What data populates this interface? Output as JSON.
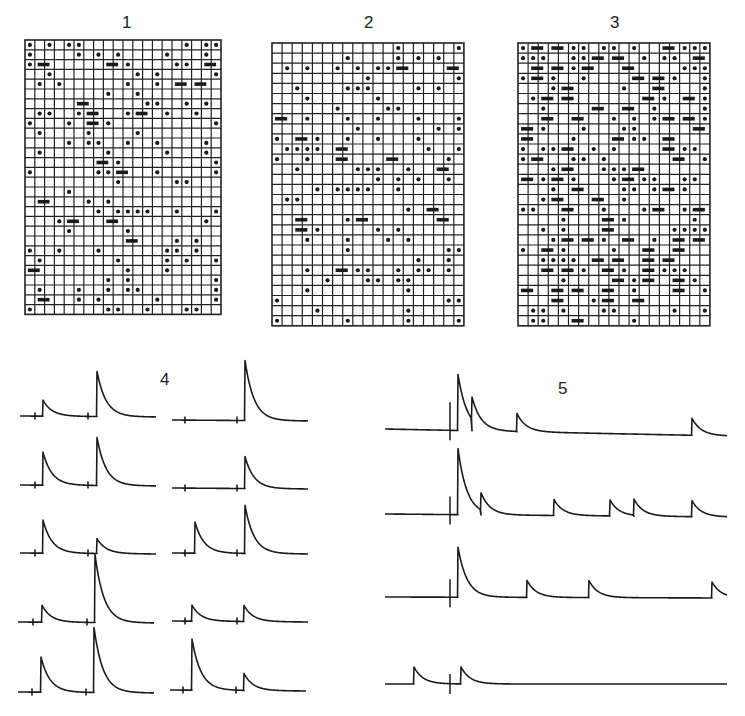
{
  "figure": {
    "panels": [
      {
        "id": "1",
        "label": "1",
        "label_pos": [
          122,
          14
        ]
      },
      {
        "id": "2",
        "label": "2",
        "label_pos": [
          364,
          14
        ]
      },
      {
        "id": "3",
        "label": "3",
        "label_pos": [
          610,
          14
        ]
      },
      {
        "id": "4",
        "label": "4",
        "label_pos": [
          160,
          371
        ]
      },
      {
        "id": "5",
        "label": "5",
        "label_pos": [
          558,
          380
        ]
      }
    ],
    "colors": {
      "ink": "#1a1a1a",
      "grid": "#222222",
      "background": "#ffffff"
    }
  },
  "grids": [
    {
      "name": "grid-panel-1",
      "x": 25,
      "y": 40,
      "cols": 20,
      "rows": 28,
      "cell": 9.8,
      "skew_top": -2,
      "density": 0.26,
      "pair_rate": 0.18,
      "seed": 11
    },
    {
      "name": "grid-panel-2",
      "x": 272,
      "y": 43,
      "cols": 19,
      "rows": 28,
      "cell": 10.1,
      "skew_top": -3,
      "density": 0.18,
      "pair_rate": 0.14,
      "seed": 23
    },
    {
      "name": "grid-panel-3",
      "x": 518,
      "y": 43,
      "cols": 19,
      "rows": 28,
      "cell": 10.1,
      "skew_top": -2,
      "density": 0.42,
      "pair_rate": 0.45,
      "seed": 37
    }
  ],
  "traces_panel4": {
    "decay": 9,
    "width": 136,
    "rows": [
      {
        "left": {
          "x": 20,
          "y": 416,
          "ticks": [
            35,
            88
          ],
          "peaks": [
            {
              "x": 43,
              "h": 16
            },
            {
              "x": 97,
              "h": 45
            }
          ]
        },
        "right": {
          "x": 172,
          "y": 420,
          "ticks": [
            185,
            237
          ],
          "peaks": [
            {
              "x": 245,
              "h": 60
            }
          ]
        }
      },
      {
        "left": {
          "x": 20,
          "y": 485,
          "ticks": [
            35,
            88
          ],
          "peaks": [
            {
              "x": 43,
              "h": 33
            },
            {
              "x": 97,
              "h": 48
            }
          ]
        },
        "right": {
          "x": 172,
          "y": 488,
          "ticks": [
            185,
            237
          ],
          "peaks": [
            {
              "x": 245,
              "h": 32
            }
          ]
        }
      },
      {
        "left": {
          "x": 20,
          "y": 553,
          "ticks": [
            35,
            88
          ],
          "peaks": [
            {
              "x": 43,
              "h": 33
            },
            {
              "x": 97,
              "h": 15
            }
          ]
        },
        "right": {
          "x": 172,
          "y": 553,
          "ticks": [
            185,
            237
          ],
          "peaks": [
            {
              "x": 195,
              "h": 31
            },
            {
              "x": 245,
              "h": 48
            }
          ]
        }
      },
      {
        "left": {
          "x": 18,
          "y": 622,
          "ticks": [
            33,
            87
          ],
          "peaks": [
            {
              "x": 42,
              "h": 17
            },
            {
              "x": 95,
              "h": 68
            }
          ]
        },
        "right": {
          "x": 172,
          "y": 621,
          "ticks": [
            185,
            237
          ],
          "peaks": [
            {
              "x": 192,
              "h": 16
            },
            {
              "x": 244,
              "h": 16
            }
          ]
        }
      },
      {
        "left": {
          "x": 18,
          "y": 692,
          "ticks": [
            32,
            86
          ],
          "peaks": [
            {
              "x": 41,
              "h": 35
            },
            {
              "x": 94,
              "h": 65
            }
          ]
        },
        "right": {
          "x": 170,
          "y": 690,
          "ticks": [
            183,
            236
          ],
          "peaks": [
            {
              "x": 192,
              "h": 51
            },
            {
              "x": 244,
              "h": 17
            }
          ]
        }
      }
    ]
  },
  "traces_panel5": {
    "x_start": 385,
    "x_end": 727,
    "stimulus_x": 450,
    "decay": 9,
    "rows": [
      {
        "y": 429,
        "y_end": 436,
        "stim_h": 28,
        "peaks": [
          {
            "x": 458,
            "h": 56
          },
          {
            "x": 472,
            "h": 22
          },
          {
            "x": 517,
            "h": 18
          },
          {
            "x": 692,
            "h": 17
          }
        ]
      },
      {
        "y": 514,
        "y_end": 517,
        "stim_h": 18,
        "peaks": [
          {
            "x": 458,
            "h": 66
          },
          {
            "x": 481,
            "h": 17
          },
          {
            "x": 554,
            "h": 16
          },
          {
            "x": 610,
            "h": 16
          },
          {
            "x": 634,
            "h": 16
          },
          {
            "x": 692,
            "h": 16
          }
        ]
      },
      {
        "y": 597,
        "y_end": 598,
        "stim_h": 18,
        "peaks": [
          {
            "x": 458,
            "h": 50
          },
          {
            "x": 527,
            "h": 17
          },
          {
            "x": 589,
            "h": 17
          },
          {
            "x": 712,
            "h": 16
          }
        ]
      },
      {
        "y": 684,
        "y_end": 684,
        "stim_h": 10,
        "peaks": [
          {
            "x": 414,
            "h": 17
          },
          {
            "x": 461,
            "h": 17
          }
        ]
      }
    ]
  }
}
